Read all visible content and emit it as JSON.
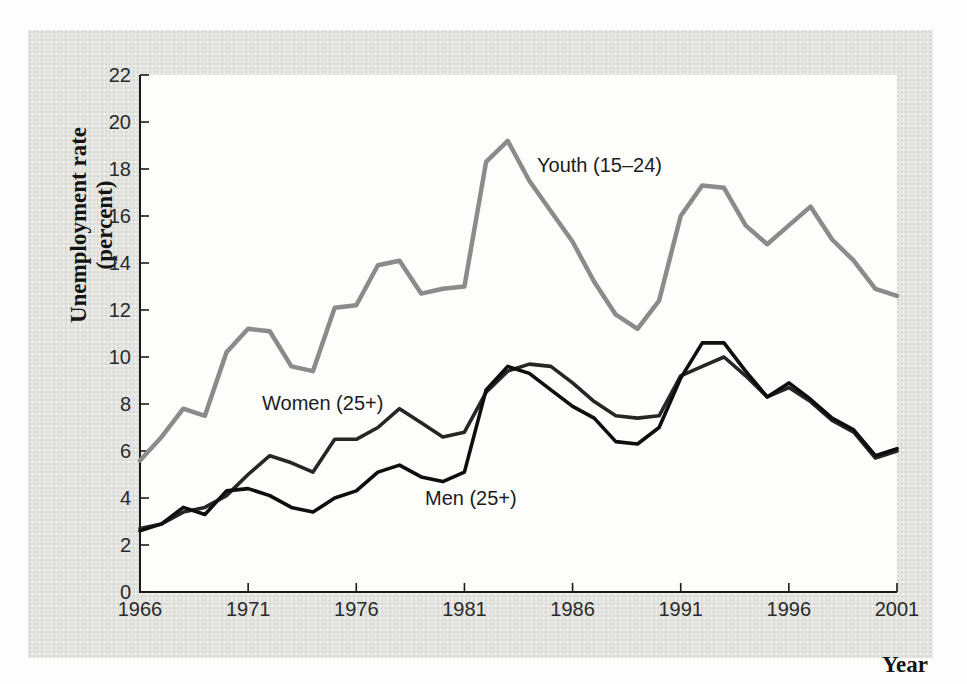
{
  "figure": {
    "y_axis_title_line1": "Unemployment rate",
    "y_axis_title_line2": "(percent)",
    "x_axis_title": "Year"
  },
  "colors": {
    "card_background": "#e6e6e3",
    "plot_background": "#fdfdfc",
    "axis": "#1a1a1a",
    "tick_label": "#2a2a2a",
    "youth_line": "#8b8b8b",
    "women_line": "#262626",
    "men_line": "#0e0e0e"
  },
  "chart_data": {
    "type": "line",
    "title": "",
    "xlabel": "Year",
    "ylabel": "Unemployment rate (percent)",
    "xlim": [
      1966,
      2001
    ],
    "ylim": [
      0,
      22
    ],
    "grid": false,
    "legend_position": "inline-annotations",
    "x_ticks": [
      1966,
      1971,
      1976,
      1981,
      1986,
      1991,
      1996,
      2001
    ],
    "y_ticks": [
      0,
      2,
      4,
      6,
      8,
      10,
      12,
      14,
      16,
      18,
      20,
      22
    ],
    "x": [
      1966,
      1967,
      1968,
      1969,
      1970,
      1971,
      1972,
      1973,
      1974,
      1975,
      1976,
      1977,
      1978,
      1979,
      1980,
      1981,
      1982,
      1983,
      1984,
      1985,
      1986,
      1987,
      1988,
      1989,
      1990,
      1991,
      1992,
      1993,
      1994,
      1995,
      1996,
      1997,
      1998,
      1999,
      2000,
      2001
    ],
    "series": [
      {
        "name": "Youth (15–24)",
        "color": "#8b8b8b",
        "width": 4.5,
        "values": [
          5.6,
          6.6,
          7.8,
          7.5,
          10.2,
          11.2,
          11.1,
          9.6,
          9.4,
          12.1,
          12.2,
          13.9,
          14.1,
          12.7,
          12.9,
          13.0,
          18.3,
          19.2,
          17.5,
          16.2,
          14.9,
          13.2,
          11.8,
          11.2,
          12.4,
          16.0,
          17.3,
          17.2,
          15.6,
          14.8,
          15.6,
          16.4,
          15.0,
          14.1,
          12.9,
          12.6
        ]
      },
      {
        "name": "Women (25+)",
        "color": "#262626",
        "width": 3.6,
        "values": [
          2.7,
          2.9,
          3.4,
          3.6,
          4.1,
          5.0,
          5.8,
          5.5,
          5.1,
          6.5,
          6.5,
          7.0,
          7.8,
          7.2,
          6.6,
          6.8,
          8.5,
          9.4,
          9.7,
          9.6,
          8.9,
          8.1,
          7.5,
          7.4,
          7.5,
          9.2,
          9.6,
          10.0,
          9.2,
          8.3,
          8.7,
          8.1,
          7.3,
          6.8,
          5.7,
          6.0
        ]
      },
      {
        "name": "Men (25+)",
        "color": "#0e0e0e",
        "width": 3.6,
        "values": [
          2.6,
          2.9,
          3.6,
          3.3,
          4.3,
          4.4,
          4.1,
          3.6,
          3.4,
          4.0,
          4.3,
          5.1,
          5.4,
          4.9,
          4.7,
          5.1,
          8.6,
          9.6,
          9.3,
          8.6,
          7.9,
          7.4,
          6.4,
          6.3,
          7.0,
          9.1,
          10.6,
          10.6,
          9.4,
          8.3,
          8.9,
          8.2,
          7.4,
          6.9,
          5.8,
          6.1
        ]
      }
    ],
    "annotations": [
      {
        "id": "youth",
        "text": "Youth (15–24)",
        "x": 537,
        "y": 172
      },
      {
        "id": "women",
        "text": "Women (25+)",
        "x": 262,
        "y": 410
      },
      {
        "id": "men",
        "text": "Men (25+)",
        "x": 425,
        "y": 505
      }
    ]
  }
}
